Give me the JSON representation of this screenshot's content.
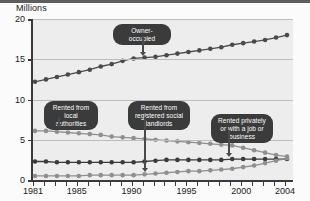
{
  "chart_data": {
    "type": "line",
    "title": "",
    "ylabel": "Millions",
    "xlabel": "",
    "ylim": [
      0,
      20
    ],
    "yticks": [
      0,
      5,
      10,
      15,
      20
    ],
    "xlim": [
      1981,
      2004
    ],
    "x": [
      1981,
      1982,
      1983,
      1984,
      1985,
      1986,
      1987,
      1988,
      1989,
      1990,
      1991,
      1992,
      1993,
      1994,
      1995,
      1996,
      1997,
      1998,
      1999,
      2000,
      2001,
      2002,
      2003,
      2004
    ],
    "xticks_labeled": [
      "1981",
      "1985",
      "1990",
      "1995",
      "2000",
      "2004"
    ],
    "xticks_labeled_values": [
      1981,
      1985,
      1990,
      1995,
      2000,
      2004
    ],
    "grid": "horizontal",
    "legend": "none (inline callout labels)",
    "series": [
      {
        "name": "Owner-occupied",
        "color": "#4a4a4a",
        "values": [
          12.2,
          12.5,
          12.8,
          13.1,
          13.4,
          13.7,
          14.1,
          14.4,
          14.8,
          15.1,
          15.2,
          15.3,
          15.5,
          15.7,
          15.9,
          16.1,
          16.3,
          16.5,
          16.8,
          17.0,
          17.2,
          17.4,
          17.7,
          18.0
        ]
      },
      {
        "name": "Rented from local authorities",
        "color": "#8f8f8f",
        "values": [
          6.1,
          6.1,
          6.0,
          5.9,
          5.8,
          5.7,
          5.6,
          5.4,
          5.3,
          5.2,
          5.1,
          5.0,
          4.9,
          4.8,
          4.7,
          4.6,
          4.5,
          4.4,
          4.3,
          4.0,
          3.7,
          3.4,
          3.1,
          2.9
        ]
      },
      {
        "name": "Rented privately or with a job or business",
        "color": "#3a3a3a",
        "values": [
          2.3,
          2.3,
          2.2,
          2.2,
          2.2,
          2.2,
          2.2,
          2.2,
          2.2,
          2.2,
          2.3,
          2.4,
          2.5,
          2.5,
          2.5,
          2.5,
          2.5,
          2.5,
          2.6,
          2.6,
          2.6,
          2.6,
          2.6,
          2.6
        ]
      },
      {
        "name": "Rented from registered social landlords",
        "color": "#8f8f8f",
        "values": [
          0.5,
          0.5,
          0.5,
          0.5,
          0.5,
          0.6,
          0.6,
          0.6,
          0.6,
          0.6,
          0.7,
          0.8,
          0.9,
          1.0,
          1.1,
          1.1,
          1.2,
          1.3,
          1.4,
          1.6,
          1.8,
          2.1,
          2.4,
          2.7
        ]
      }
    ],
    "annotations": [
      {
        "text": "Owner-occupied",
        "target_series": "Owner-occupied",
        "target_x": 1989,
        "target_y": 15.0
      },
      {
        "text": "Rented from local authorities",
        "target_series": "Rented from local authorities",
        "target_x": 1982,
        "target_y": 6.1
      },
      {
        "text": "Rented from registered social landlords",
        "target_series": "Rented from registered social landlords",
        "target_x": 1990,
        "target_y": 0.6
      },
      {
        "text": "Rented privately or with a job or business",
        "target_series": "Rented privately or with a job or business",
        "target_x": 1998,
        "target_y": 2.5
      }
    ]
  },
  "colors": {
    "plot_background": "#ededed",
    "page_background": "#fbfbfb",
    "axis": "#3a3a3a",
    "gridline": "#bdbdbd",
    "callout_background": "#3b3b3b",
    "callout_text": "#ffffff"
  }
}
